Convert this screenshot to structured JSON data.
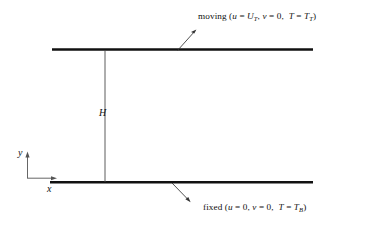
{
  "figure": {
    "type": "couette-flow-diagram",
    "background_color": "#ffffff",
    "line_color": "#111111"
  },
  "plates": {
    "top": {
      "label_prefix": "moving",
      "open_paren": "(",
      "u_symbol": "u",
      "eq": "=",
      "u_value": "U",
      "u_value_sub": "T",
      "comma1": ",",
      "v_symbol": "v",
      "v_value": "0",
      "comma2": ",",
      "t_symbol": "T",
      "t_value": "T",
      "t_value_sub": "T",
      "close_paren": ")"
    },
    "bottom": {
      "label_prefix": "fixed",
      "open_paren": "(",
      "u_symbol": "u",
      "eq": "=",
      "u_value": "0",
      "comma1": ",",
      "v_symbol": "v",
      "v_value": "0",
      "comma2": ",",
      "t_symbol": "T",
      "t_value": "T",
      "t_value_sub": "B",
      "close_paren": ")"
    }
  },
  "dimensions": {
    "gap_label": "H"
  },
  "axes": {
    "y_label": "y",
    "x_label": "x"
  }
}
